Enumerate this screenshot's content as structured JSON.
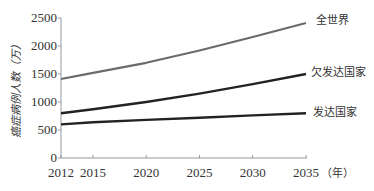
{
  "chart_data": {
    "type": "line",
    "title": "",
    "xlabel": "（年）",
    "ylabel": "癌症病例人数（万）",
    "x": [
      2012,
      2015,
      2020,
      2025,
      2030,
      2035
    ],
    "xlim": [
      2012,
      2035
    ],
    "ylim": [
      0,
      2500
    ],
    "y_ticks": [
      0,
      500,
      1000,
      1500,
      2000,
      2500
    ],
    "x_ticks": [
      2012,
      2015,
      2020,
      2025,
      2030,
      2035
    ],
    "grid": false,
    "legend_position": "inline-right",
    "series": [
      {
        "name": "全世界",
        "color": "#6b6b6b",
        "values": [
          1410,
          1520,
          1700,
          1920,
          2160,
          2410
        ]
      },
      {
        "name": "欠发达国家",
        "color": "#222222",
        "values": [
          800,
          870,
          1000,
          1150,
          1320,
          1500
        ]
      },
      {
        "name": "发达国家",
        "color": "#222222",
        "values": [
          600,
          640,
          680,
          720,
          760,
          800
        ]
      }
    ]
  },
  "axis": {
    "y_tick_labels": [
      "0",
      "500",
      "1000",
      "1500",
      "2000",
      "2500"
    ],
    "x_tick_labels": [
      "2012",
      "2015",
      "2020",
      "2025",
      "2030",
      "2035"
    ],
    "x_unit": "（年）",
    "y_title": "癌症病例人数（万）"
  },
  "legend": {
    "world": "全世界",
    "less_developed": "欠发达国家",
    "developed": "发达国家"
  }
}
